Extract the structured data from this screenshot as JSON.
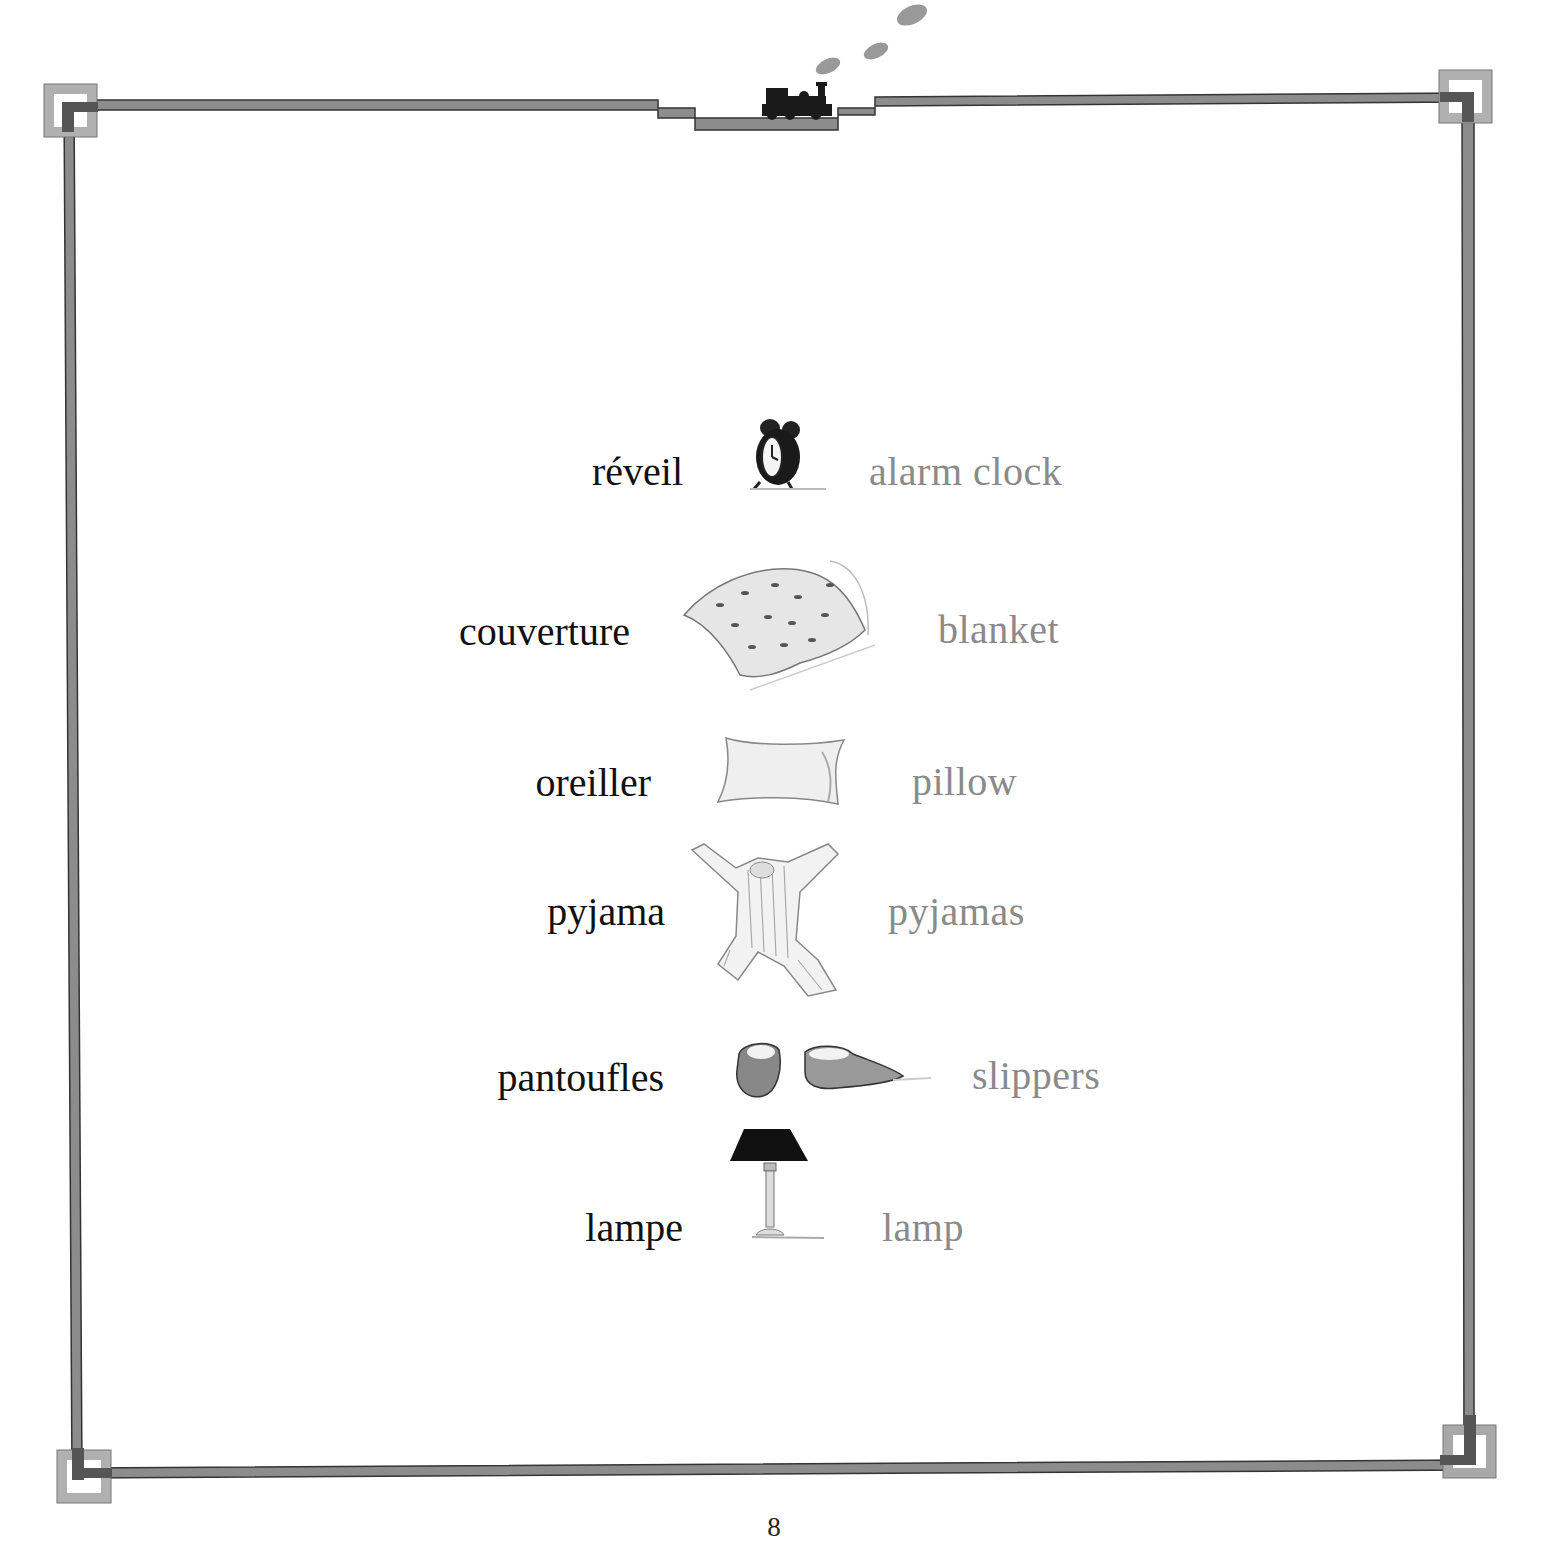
{
  "page": {
    "page_number": "8",
    "colors": {
      "french_text": "#111111",
      "english_text": "#8a8a8a",
      "border": "#555555",
      "corner_box": "#a8a8a8"
    }
  },
  "decoration": {
    "top_center": "train-icon",
    "corners": [
      "corner-square-top-left",
      "corner-square-top-right",
      "corner-square-bottom-left",
      "corner-square-bottom-right"
    ]
  },
  "vocabulary": [
    {
      "french": "réveil",
      "icon": "alarm-clock-icon",
      "english": "alarm clock"
    },
    {
      "french": "couverture",
      "icon": "blanket-icon",
      "english": "blanket"
    },
    {
      "french": "oreiller",
      "icon": "pillow-icon",
      "english": "pillow"
    },
    {
      "french": "pyjama",
      "icon": "pyjamas-icon",
      "english": "pyjamas"
    },
    {
      "french": "pantoufles",
      "icon": "slippers-icon",
      "english": "slippers"
    },
    {
      "french": "lampe",
      "icon": "lamp-icon",
      "english": "lamp"
    }
  ]
}
